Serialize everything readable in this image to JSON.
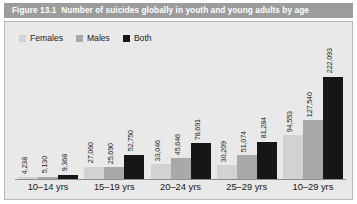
{
  "figure": {
    "number": "Figure 13.1",
    "title": "Number of suicides globally in youth and young adults by age"
  },
  "colors": {
    "title_bar": "#9c9c9c",
    "panel_bg": "#e9e9e9",
    "females": "#d2d2d2",
    "males": "#a9a9a9",
    "both": "#161616",
    "axis": "#8d8d8d"
  },
  "legend": {
    "position": "top-left",
    "items": [
      {
        "label": "Females",
        "color": "#d2d2d2",
        "swatch_name": "legend-swatch-females"
      },
      {
        "label": "Males",
        "color": "#a9a9a9",
        "swatch_name": "legend-swatch-males"
      },
      {
        "label": "Both",
        "color": "#161616",
        "swatch_name": "legend-swatch-both"
      }
    ]
  },
  "chart_data": {
    "type": "bar",
    "title": "Number of suicides globally in youth and young adults by age",
    "xlabel": "",
    "ylabel": "",
    "grid": false,
    "legend_position": "top-left",
    "ylim": [
      0,
      222093
    ],
    "categories": [
      "10–14 yrs",
      "15–19 yrs",
      "20–24 yrs",
      "25–29 yrs",
      "10–29 yrs"
    ],
    "series": [
      {
        "name": "Females",
        "color": "#d2d2d2",
        "values": [
          4238,
          27060,
          33046,
          30209,
          94553
        ],
        "labels": [
          "4,238",
          "27,060",
          "33,046",
          "30,209",
          "94,553"
        ]
      },
      {
        "name": "Males",
        "color": "#a9a9a9",
        "values": [
          5130,
          25690,
          45646,
          51074,
          127540
        ],
        "labels": [
          "5,130",
          "25,690",
          "45,646",
          "51,074",
          "127,540"
        ]
      },
      {
        "name": "Both",
        "color": "#161616",
        "values": [
          9368,
          52750,
          78691,
          81284,
          222093
        ],
        "labels": [
          "9,368",
          "52,750",
          "78,691",
          "81,284",
          "222,093"
        ]
      }
    ]
  }
}
